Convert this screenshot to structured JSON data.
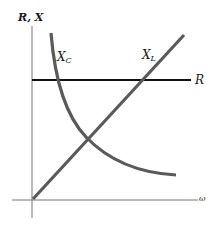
{
  "diagram": {
    "y_axis_label": "R, X",
    "x_axis_label": "ω",
    "curves": {
      "capacitive_reactance": {
        "label_main": "X",
        "label_sub": "C",
        "color": "#5a5a5a"
      },
      "inductive_reactance": {
        "label_main": "X",
        "label_sub": "L",
        "color": "#5a5a5a"
      },
      "resistance": {
        "label": "R",
        "color": "#111111"
      }
    },
    "axis_color": "#777777"
  }
}
